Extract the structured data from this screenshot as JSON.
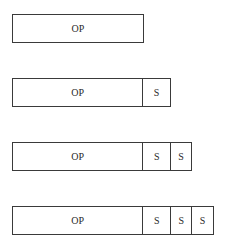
{
  "diagram": {
    "rows": [
      {
        "op_label": "OP",
        "s_cells": []
      },
      {
        "op_label": "OP",
        "s_cells": [
          "S"
        ]
      },
      {
        "op_label": "OP",
        "s_cells": [
          "S",
          "S"
        ]
      },
      {
        "op_label": "OP",
        "s_cells": [
          "S",
          "S",
          "S"
        ]
      }
    ]
  }
}
